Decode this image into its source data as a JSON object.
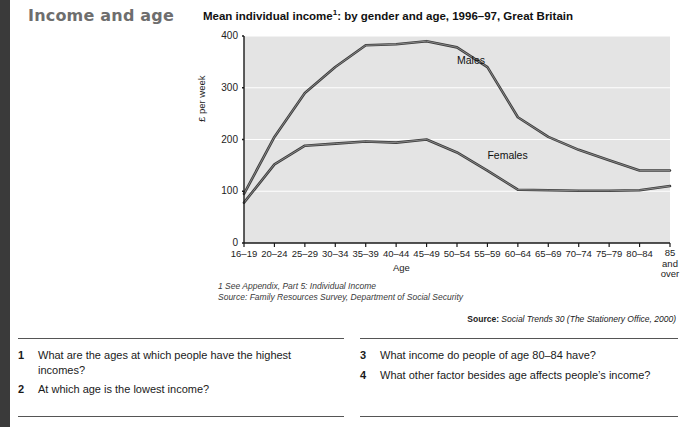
{
  "header": {
    "section_title": "Income and age",
    "chart_title_main": "Mean individual income",
    "chart_title_sup": "1",
    "chart_title_rest": ": by gender and age, 1996–97, Great Britain"
  },
  "chart_data": {
    "type": "line",
    "xlabel": "Age",
    "ylabel": "£ per week",
    "ylim": [
      0,
      400
    ],
    "yticks": [
      "0",
      "100",
      "200",
      "300",
      "400"
    ],
    "grid": true,
    "legend_position": "inline-annotations",
    "categories": [
      "16–19",
      "20–24",
      "25–29",
      "30–34",
      "35–39",
      "40–44",
      "45–49",
      "50–54",
      "55–59",
      "60–64",
      "65–69",
      "70–74",
      "75–79",
      "80–84",
      "85 and over"
    ],
    "last_category_lines": [
      "85",
      "and",
      "over"
    ],
    "series": [
      {
        "name": "Males",
        "values": [
          95,
          205,
          290,
          340,
          382,
          384,
          390,
          378,
          340,
          243,
          205,
          180,
          160,
          140,
          140
        ]
      },
      {
        "name": "Females",
        "values": [
          78,
          152,
          188,
          192,
          196,
          194,
          200,
          175,
          140,
          103,
          102,
          101,
          101,
          102,
          110
        ]
      }
    ],
    "annotations": [
      {
        "text": "Males",
        "x_category": "50–54",
        "y_value": 345
      },
      {
        "text": "Females",
        "x_category": "55–59",
        "y_value": 163
      }
    ]
  },
  "footnotes": {
    "note1": "1 See Appendix, Part 5: Individual Income",
    "note2": "Source: Family Resources Survey, Department of Social Security"
  },
  "source": {
    "label": "Source:",
    "text": " Social Trends 30 (The Stationery Office, 2000)"
  },
  "questions": [
    {
      "num": "1",
      "text": "What are the ages at which people have the highest incomes?"
    },
    {
      "num": "2",
      "text": "At which age is the lowest income?"
    },
    {
      "num": "3",
      "text": "What income do people of age 80–84 have?"
    },
    {
      "num": "4",
      "text": "What other factor besides age affects people’s income?"
    }
  ],
  "colors": {
    "plot_background": "#e4e4e4",
    "gridline": "#ffffff",
    "line": "#3d3d3d",
    "axis": "#1a1a1a",
    "section_title": "#6e6e6e",
    "edge_bar": "#3a3a3a"
  }
}
